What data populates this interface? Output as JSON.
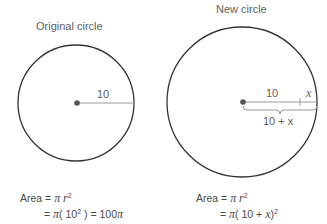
{
  "original": {
    "title": "Original circle",
    "radius_label": "10",
    "area_line1": "Area = π r²",
    "area_line2": "= π( 10² ) = 100π"
  },
  "new": {
    "title": "New circle",
    "segment_label_a": "10",
    "segment_label_b": "x",
    "brace_label": "10 + x",
    "area_line1": "Area = π r²",
    "area_line2": "= π( 10 + x)²"
  },
  "colors": {
    "circle_stroke": "#333333",
    "radius_line": "#888888",
    "center_dot": "#555555"
  }
}
